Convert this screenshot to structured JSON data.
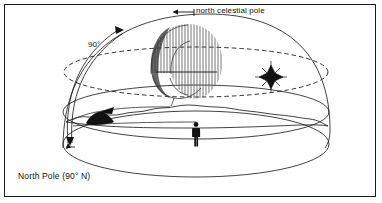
{
  "figure": {
    "background_color": "#ffffff",
    "border_color": "#1a1a1a",
    "ink_color": "#111111"
  },
  "labels": {
    "north_celestial_pole": "north celestial pole",
    "zenith_angle": "90°",
    "location": "North Pole (90° N)"
  },
  "elements": {
    "dome_name": "celestial-hemisphere-dome",
    "celestial_equator_name": "celestial-equator-dashed-ellipse",
    "horizon_plane_name": "horizon-plane-ellipse",
    "star_trails_name": "star-trail-hatching",
    "star_name": "star",
    "observer_name": "observer-silhouette",
    "landscape_name": "landscape-horizon",
    "hill_name": "dark-hill",
    "angle_arc_name": "ninety-degree-arc-arrow",
    "pole_leader_name": "north-celestial-pole-leader-arrow"
  }
}
